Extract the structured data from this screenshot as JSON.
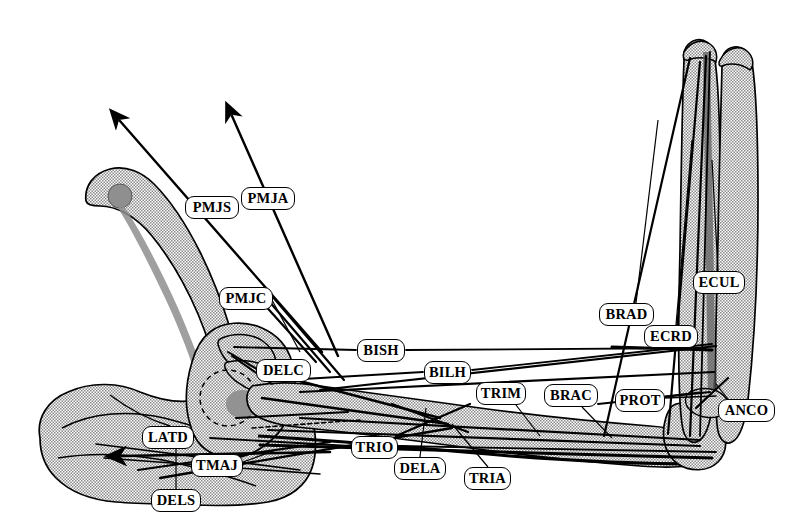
{
  "figure": {
    "width": 798,
    "height": 531,
    "background_color": "#ffffff",
    "bone_fill_color": "#b9b9b9",
    "bone_outline_color": "#000000",
    "muscle_line_color": "#000000",
    "label_text_color": "#000000",
    "label_fill_color": "#ffffff"
  },
  "labels": [
    {
      "id": "PMJS",
      "text": "PMJS",
      "x": 185,
      "y": 196,
      "w": 54,
      "h": 23,
      "leader_to_x": 148,
      "leader_to_y": 123
    },
    {
      "id": "PMJA",
      "text": "PMJA",
      "x": 241,
      "y": 187,
      "w": 54,
      "h": 23,
      "leader_to_x": 226,
      "leader_to_y": 118
    },
    {
      "id": "PMJC",
      "text": "PMJC",
      "x": 219,
      "y": 287,
      "w": 54,
      "h": 23,
      "leader_to_x": 300,
      "leader_to_y": 355
    },
    {
      "id": "DELC",
      "text": "DELC",
      "x": 256,
      "y": 359,
      "w": 55,
      "h": 23,
      "leader_to_x": 225,
      "leader_to_y": 352
    },
    {
      "id": "BISH",
      "text": "BISH",
      "x": 357,
      "y": 339,
      "w": 48,
      "h": 23,
      "leader_to_x": 236,
      "leader_to_y": 348
    },
    {
      "id": "BILH",
      "text": "BILH",
      "x": 424,
      "y": 361,
      "w": 47,
      "h": 23,
      "leader_to_x": 288,
      "leader_to_y": 378
    },
    {
      "id": "TRIM",
      "text": "TRIM",
      "x": 476,
      "y": 382,
      "w": 50,
      "h": 23,
      "leader_to_x": 508,
      "leader_to_y": 420
    },
    {
      "id": "BRAC",
      "text": "BRAC",
      "x": 544,
      "y": 384,
      "w": 54,
      "h": 23,
      "leader_to_x": 594,
      "leader_to_y": 420
    },
    {
      "id": "BRAD",
      "text": "BRAD",
      "x": 599,
      "y": 303,
      "w": 55,
      "h": 23,
      "leader_to_x": 655,
      "leader_to_y": 120
    },
    {
      "id": "ECRD",
      "text": "ECRD",
      "x": 644,
      "y": 325,
      "w": 54,
      "h": 23,
      "leader_to_x": 690,
      "leader_to_y": 130
    },
    {
      "id": "ECUL",
      "text": "ECUL",
      "x": 693,
      "y": 271,
      "w": 52,
      "h": 23,
      "leader_to_x": 705,
      "leader_to_y": 130
    },
    {
      "id": "PROT",
      "text": "PROT",
      "x": 615,
      "y": 389,
      "w": 50,
      "h": 23,
      "leader_to_x": 688,
      "leader_to_y": 398
    },
    {
      "id": "ANCO",
      "text": "ANCO",
      "x": 718,
      "y": 399,
      "w": 57,
      "h": 23,
      "leader_to_x": 706,
      "leader_to_y": 390
    },
    {
      "id": "LATD",
      "text": "LATD",
      "x": 142,
      "y": 426,
      "w": 52,
      "h": 23,
      "leader_to_x": 200,
      "leader_to_y": 430
    },
    {
      "id": "TMAJ",
      "text": "TMAJ",
      "x": 191,
      "y": 454,
      "w": 52,
      "h": 23,
      "leader_to_x": 243,
      "leader_to_y": 447
    },
    {
      "id": "DELS",
      "text": "DELS",
      "x": 151,
      "y": 489,
      "w": 50,
      "h": 23,
      "leader_to_x": 176,
      "leader_to_y": 440
    },
    {
      "id": "TRIO",
      "text": "TRIO",
      "x": 351,
      "y": 436,
      "w": 47,
      "h": 23,
      "leader_to_x": 270,
      "leader_to_y": 430
    },
    {
      "id": "DELA",
      "text": "DELA",
      "x": 394,
      "y": 457,
      "w": 52,
      "h": 23,
      "leader_to_x": 424,
      "leader_to_y": 408
    },
    {
      "id": "TRIA",
      "text": "TRIA",
      "x": 464,
      "y": 467,
      "w": 47,
      "h": 23,
      "leader_to_x": 447,
      "leader_to_y": 424
    }
  ],
  "arrows": [
    {
      "id": "pmjs-arrow",
      "from_x": 320,
      "from_y": 350,
      "to_x": 117,
      "to_y": 118
    },
    {
      "id": "pmja-arrow",
      "from_x": 335,
      "from_y": 355,
      "to_x": 230,
      "to_y": 112
    },
    {
      "id": "latd-arrow",
      "from_x": 330,
      "from_y": 455,
      "to_x": 120,
      "to_y": 455
    }
  ],
  "bones": [
    {
      "id": "clavicle",
      "name": "clavicle"
    },
    {
      "id": "scapula",
      "name": "scapula"
    },
    {
      "id": "humerus",
      "name": "humerus"
    },
    {
      "id": "radius",
      "name": "radius"
    },
    {
      "id": "ulna",
      "name": "ulna"
    },
    {
      "id": "thorax",
      "name": "thorax"
    }
  ]
}
